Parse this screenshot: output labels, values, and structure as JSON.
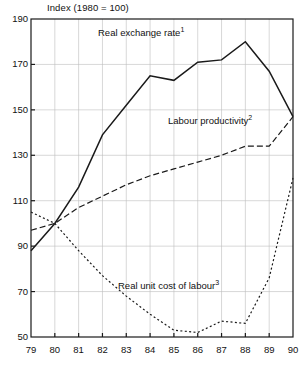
{
  "chart_data": {
    "type": "line",
    "title": "Index (1980 = 100)",
    "xlabel": "",
    "ylabel": "",
    "grid": true,
    "legend_position": "inline-annotations",
    "x": [
      "79",
      "80",
      "81",
      "82",
      "83",
      "84",
      "85",
      "86",
      "87",
      "88",
      "89",
      "90"
    ],
    "xlim": [
      79,
      90
    ],
    "ylim": [
      50,
      190
    ],
    "yticks": [
      50,
      70,
      90,
      110,
      130,
      150,
      170,
      190
    ],
    "xticks": [
      "79",
      "80",
      "81",
      "82",
      "83",
      "84",
      "85",
      "86",
      "87",
      "88",
      "89",
      "90"
    ],
    "series": [
      {
        "name": "Real exchange rate",
        "footnote": "1",
        "style": "solid",
        "values": [
          88,
          100,
          116,
          139,
          152,
          165,
          163,
          171,
          172,
          180,
          167,
          147
        ]
      },
      {
        "name": "Labour productivity",
        "footnote": "2",
        "style": "dashed",
        "values": [
          97,
          100,
          107,
          112,
          117,
          121,
          124,
          127,
          130,
          134,
          134,
          147
        ]
      },
      {
        "name": "Real unit cost of labour",
        "footnote": "3",
        "style": "dotted",
        "values": [
          105,
          100,
          88,
          77,
          68,
          60,
          53,
          52,
          57,
          56,
          76,
          120
        ]
      }
    ]
  },
  "labels": {
    "real_exchange_rate": "Real exchange rate",
    "real_exchange_rate_note": "1",
    "labour_productivity": "Labour productivity",
    "labour_productivity_note": "2",
    "real_unit_cost": "Real unit cost of labour",
    "real_unit_cost_note": "3"
  },
  "colors": {
    "line": "#1a1a1a",
    "grid": "#bdbdbd",
    "axis": "#1a1a1a",
    "background": "#ffffff"
  }
}
